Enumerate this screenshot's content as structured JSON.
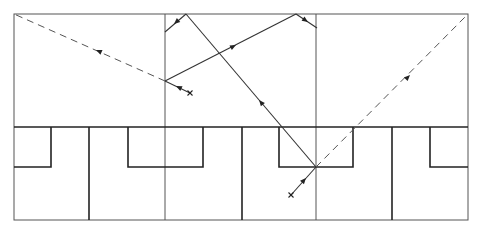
{
  "diagram": {
    "colors": {
      "line": "#222222",
      "thin_line": "#555555",
      "background": "#ffffff"
    },
    "frame": {
      "left": 14,
      "top": 14,
      "right": 468,
      "bottom": 220
    },
    "divider_y": 127,
    "thin_verticals_x": [
      165,
      316
    ],
    "thick_verticals_x": [
      89,
      242,
      392
    ],
    "recesses": [
      {
        "x1": 14,
        "x2": 51,
        "y_top": 127,
        "y_bottom": 167
      },
      {
        "x1": 128,
        "x2": 203,
        "y_top": 127,
        "y_bottom": 167
      },
      {
        "x1": 279,
        "x2": 353,
        "y_top": 127,
        "y_bottom": 167
      },
      {
        "x1": 430,
        "x2": 468,
        "y_top": 127,
        "y_bottom": 167
      }
    ],
    "sources": [
      {
        "name": "source-upper",
        "x": 190,
        "y": 93
      },
      {
        "name": "source-lower",
        "x": 291,
        "y": 195
      }
    ],
    "solid_rays": [
      {
        "name": "upper-incident",
        "points": [
          [
            190,
            93
          ],
          [
            165,
            81
          ]
        ],
        "arrow_at": [
          176,
          86
        ]
      },
      {
        "name": "upper-reflect-1",
        "points": [
          [
            165,
            81
          ],
          [
            296,
            14
          ]
        ],
        "arrow_at": [
          236,
          45
        ]
      },
      {
        "name": "upper-reflect-2",
        "points": [
          [
            296,
            14
          ],
          [
            317,
            28
          ]
        ],
        "arrow_at": [
          308,
          22
        ]
      },
      {
        "name": "lower-incident",
        "points": [
          [
            291,
            195
          ],
          [
            316,
            167
          ]
        ],
        "arrow_at": [
          306,
          178
        ]
      },
      {
        "name": "lower-reflect-1",
        "points": [
          [
            316,
            167
          ],
          [
            186,
            14
          ]
        ],
        "arrow_at": [
          259,
          100
        ]
      },
      {
        "name": "lower-reflect-2",
        "points": [
          [
            186,
            14
          ],
          [
            165,
            32
          ]
        ],
        "arrow_at": [
          174,
          24
        ]
      }
    ],
    "dashed_rays": [
      {
        "name": "upper-virtual",
        "points": [
          [
            165,
            81
          ],
          [
            14,
            14
          ]
        ],
        "arrow_at": [
          96,
          50
        ]
      },
      {
        "name": "lower-virtual",
        "points": [
          [
            316,
            167
          ],
          [
            468,
            14
          ]
        ],
        "arrow_at": [
          410,
          75
        ]
      }
    ]
  }
}
